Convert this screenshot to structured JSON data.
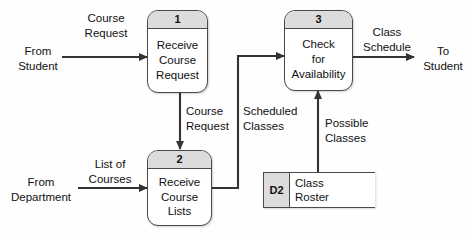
{
  "diagram": {
    "type": "data-flow-diagram",
    "background_color": "#fefefe",
    "line_color": "#333333",
    "header_fill": "#dcdcdc",
    "box_fill": "#ffffff"
  },
  "processes": [
    {
      "id": "1",
      "number": "1",
      "lines": [
        "Receive",
        "Course",
        "Request"
      ]
    },
    {
      "id": "2",
      "number": "2",
      "lines": [
        "Receive",
        "Course",
        "Lists"
      ]
    },
    {
      "id": "3",
      "number": "3",
      "lines": [
        "Check",
        "for",
        "Availability"
      ]
    }
  ],
  "data_stores": [
    {
      "id": "D2",
      "lines": [
        "Class",
        "Roster"
      ]
    }
  ],
  "external_entities": [
    {
      "id": "from-student",
      "lines": [
        "From",
        "Student"
      ]
    },
    {
      "id": "to-student",
      "lines": [
        "To",
        "Student"
      ]
    },
    {
      "id": "from-department",
      "lines": [
        "From",
        "Department"
      ]
    }
  ],
  "flows": [
    {
      "id": "course-request-in",
      "lines": [
        "Course",
        "Request"
      ]
    },
    {
      "id": "course-request-internal",
      "lines": [
        "Course",
        "Request"
      ]
    },
    {
      "id": "scheduled-classes",
      "lines": [
        "Scheduled",
        "Classes"
      ]
    },
    {
      "id": "class-schedule",
      "lines": [
        "Class",
        "Schedule"
      ]
    },
    {
      "id": "list-of-courses",
      "lines": [
        "List of",
        "Courses"
      ]
    },
    {
      "id": "possible-classes",
      "lines": [
        "Possible",
        "Classes"
      ]
    }
  ]
}
